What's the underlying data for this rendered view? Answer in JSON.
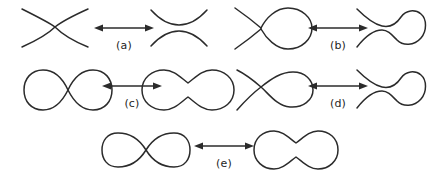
{
  "figure": {
    "type": "diagram",
    "background_color": "#ffffff",
    "stroke_color": "#2b2b2b",
    "width": 432,
    "height": 184,
    "rows": [
      {
        "id": "row-1",
        "relations": [
          {
            "label": "(a)",
            "left_figure": "crossing-x",
            "left_figure_name": "two-strand-crossing",
            "right_figure": "two-opposed-arcs",
            "right_figure_name": "smoothed-horizontal-arcs",
            "arrow": "double-headed-arrow"
          },
          {
            "label": "(b)",
            "left_figure": "crossing-with-loop",
            "left_figure_name": "crossing-with-right-loop",
            "right_figure": "pinched-arcs-with-loop",
            "right_figure_name": "smoothed-arcs-with-loop",
            "arrow": "double-headed-arrow"
          }
        ]
      },
      {
        "id": "row-2",
        "relations": [
          {
            "label": "(c)",
            "left_figure": "two-tangent-loops",
            "left_figure_name": "two-loops-meeting-at-crossing",
            "right_figure": "peanut-closed-curve",
            "right_figure_name": "dumbbell-closed-curve",
            "arrow": "double-headed-arrow"
          },
          {
            "label": "(d)",
            "left_figure": "open-crossing-with-loop",
            "left_figure_name": "open-strands-crossing-with-loop",
            "right_figure": "pinched-arcs-with-loop",
            "right_figure_name": "smoothed-arcs-with-loop",
            "arrow": "double-headed-arrow"
          }
        ]
      },
      {
        "id": "row-3",
        "relations": [
          {
            "label": "(e)",
            "left_figure": "figure-eight",
            "left_figure_name": "figure-eight-closed-curve",
            "right_figure": "peanut-closed-curve",
            "right_figure_name": "dumbbell-closed-curve",
            "arrow": "double-headed-arrow"
          }
        ]
      }
    ]
  }
}
